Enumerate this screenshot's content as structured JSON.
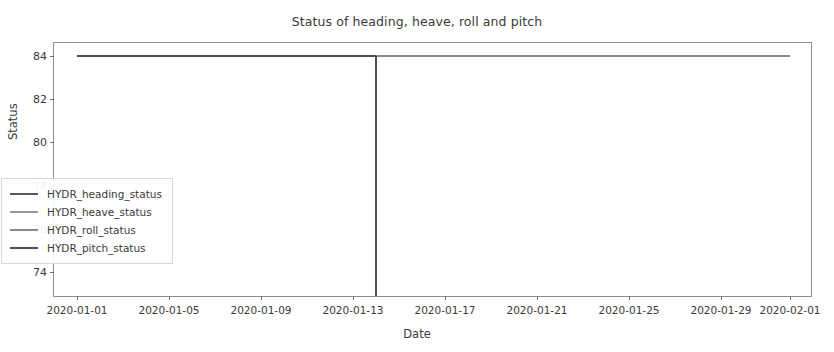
{
  "chart_data": {
    "type": "line",
    "title": "Status of heading, heave, roll and pitch",
    "xlabel": "Date",
    "ylabel": "Status",
    "grid": false,
    "legend_position": "lower left",
    "xlim": [
      "2019-12-31",
      "2020-02-02"
    ],
    "ylim": [
      72.8,
      84.6
    ],
    "ytick_labels": [
      "74",
      "76",
      "78",
      "80",
      "82",
      "84"
    ],
    "ytick_values": [
      74,
      76,
      78,
      80,
      82,
      84
    ],
    "xtick_labels": [
      "2020-01-01",
      "2020-01-05",
      "2020-01-09",
      "2020-01-13",
      "2020-01-17",
      "2020-01-21",
      "2020-01-25",
      "2020-01-29",
      "2020-02-01"
    ],
    "xtick_values": [
      "2020-01-01",
      "2020-01-05",
      "2020-01-09",
      "2020-01-13",
      "2020-01-17",
      "2020-01-21",
      "2020-01-25",
      "2020-01-29",
      "2020-02-01"
    ],
    "series": [
      {
        "name": "HYDR_heading_status",
        "color": "#5a5a5a",
        "x": [
          "2020-01-01",
          "2020-02-01"
        ],
        "values": [
          84,
          84
        ]
      },
      {
        "name": "HYDR_heave_status",
        "color": "#9a9a9a",
        "x": [
          "2020-01-01",
          "2020-02-01"
        ],
        "values": [
          84,
          84
        ]
      },
      {
        "name": "HYDR_roll_status",
        "color": "#8a8a8a",
        "x": [
          "2020-01-01",
          "2020-02-01"
        ],
        "values": [
          84,
          84
        ]
      },
      {
        "name": "HYDR_pitch_status",
        "color": "#4f4f4f",
        "x": [
          "2020-01-01",
          "2020-01-14",
          "2020-01-14",
          "2020-02-01"
        ],
        "values": [
          84,
          84,
          72.9,
          84
        ]
      }
    ],
    "annotations": [
      {
        "name": "vertical-drop",
        "x": "2020-01-14",
        "from": 84,
        "to": 72.9
      }
    ]
  },
  "legend": {
    "items": [
      {
        "label": "HYDR_heading_status",
        "color": "#5a5a5a"
      },
      {
        "label": "HYDR_heave_status",
        "color": "#9a9a9a"
      },
      {
        "label": "HYDR_roll_status",
        "color": "#8a8a8a"
      },
      {
        "label": "HYDR_pitch_status",
        "color": "#4f4f4f"
      }
    ]
  }
}
